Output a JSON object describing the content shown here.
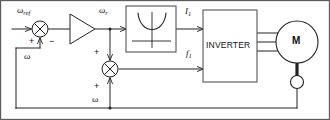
{
  "diagram": {
    "border_color": "#333333",
    "line_color": "#222222",
    "background": "#ffffff"
  },
  "signals": {
    "speed_reference": {
      "symbol": "ω",
      "subscript": "ref"
    },
    "slip_speed": {
      "symbol": "ω",
      "subscript": "r"
    },
    "feedback_speed_outer": {
      "symbol": "ω",
      "subscript": ""
    },
    "feedback_speed_inner": {
      "symbol": "ω",
      "subscript": ""
    },
    "current_command": {
      "symbol": "I",
      "subscript": "1"
    },
    "frequency_command": {
      "symbol": "f",
      "subscript": "1"
    }
  },
  "summing_junctions": [
    {
      "name": "speed-error-summer",
      "inputs": [
        {
          "sign": "+",
          "source": "speed-reference",
          "position": "left"
        },
        {
          "sign": "−",
          "source": "feedback-speed",
          "position": "bottom"
        }
      ],
      "output": "slip-speed-command"
    },
    {
      "name": "frequency-summer",
      "inputs": [
        {
          "sign": "+",
          "source": "slip-speed",
          "position": "top"
        },
        {
          "sign": "+",
          "source": "feedback-speed",
          "position": "bottom"
        }
      ],
      "output": "frequency-command"
    }
  ],
  "blocks": {
    "amplifier": {
      "label": "",
      "shape": "triangle",
      "name": "gain-amplifier"
    },
    "function_block": {
      "label": "",
      "shape": "parabola",
      "name": "current-function-block",
      "curve": "U-shaped characteristic with x and y axes"
    },
    "inverter": {
      "label": "INVERTER",
      "name": "inverter-block"
    },
    "motor": {
      "label": "M",
      "name": "motor-symbol",
      "phases": 3
    },
    "tachometer": {
      "label": "",
      "name": "tachometer-symbol"
    }
  }
}
